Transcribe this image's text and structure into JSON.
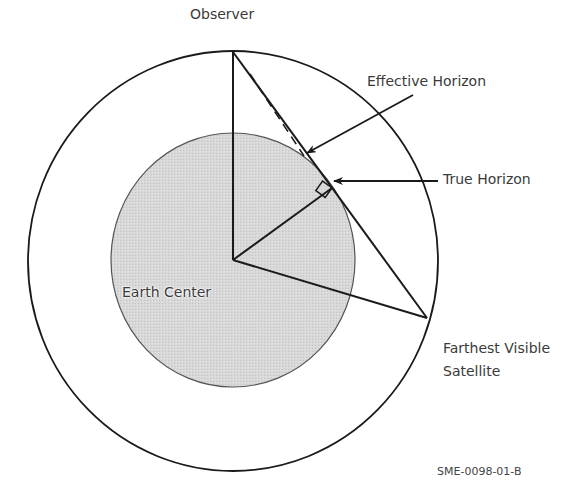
{
  "labels": {
    "observer": "Observer",
    "effective_horizon": "Effective Horizon",
    "true_horizon": "True Horizon",
    "farthest_line1": "Farthest Visible",
    "farthest_line2": "Satellite",
    "earth_center": "Earth Center",
    "figure_id": "SME-0098-01-B"
  },
  "colors": {
    "earth_fill": "#d6d6d6",
    "line": "#1a1a1a",
    "text": "#3a3a3a"
  }
}
